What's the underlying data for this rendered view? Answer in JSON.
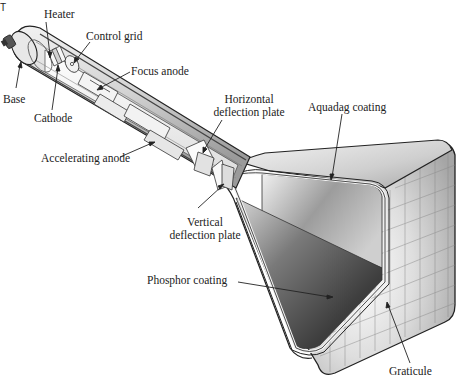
{
  "figure": {
    "corner_mark": "T",
    "labels": {
      "heater": "Heater",
      "control_grid": "Control grid",
      "focus_anode": "Focus anode",
      "base": "Base",
      "cathode": "Cathode",
      "horizontal_deflection_plate_line1": "Horizontal",
      "horizontal_deflection_plate_line2": "deflection plate",
      "aquadag_coating": "Aquadag coating",
      "accelerating_anode": "Accelerating anode",
      "vertical_deflection_plate_line1": "Vertical",
      "vertical_deflection_plate_line2": "deflection plate",
      "phosphor_coating": "Phosphor coating",
      "graticule": "Graticule"
    },
    "colors": {
      "outline": "#222222",
      "text": "#222222",
      "glass_light": "#e6e6e6",
      "glass_mid": "#bdbdbd",
      "screen_dark": "#3a3a3a",
      "background": "#ffffff"
    }
  }
}
